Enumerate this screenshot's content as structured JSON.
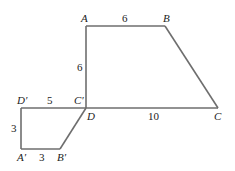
{
  "diagram": {
    "type": "geometry",
    "stroke_color": "#6e6e6e",
    "text_color": "#222222",
    "figures": [
      {
        "name": "trapezoid-ABCD",
        "vertices": [
          "A",
          "B",
          "C",
          "D"
        ],
        "points": {
          "A": [
            86,
            26
          ],
          "B": [
            165,
            26
          ],
          "C": [
            218,
            108
          ],
          "D": [
            86,
            108
          ]
        },
        "side_labels": {
          "AB": "6",
          "AD": "6",
          "DC": "10"
        }
      },
      {
        "name": "quadrilateral-A'B'C'D'",
        "vertices": [
          "A'",
          "B'",
          "C'",
          "D'"
        ],
        "points": {
          "A'": [
            21,
            149
          ],
          "B'": [
            60,
            149
          ],
          "C'": [
            86,
            108
          ],
          "D'": [
            21,
            108
          ]
        },
        "side_labels": {
          "D'C'": "5",
          "D'A'": "3",
          "A'B'": "3"
        }
      }
    ],
    "labels": {
      "A": "A",
      "B": "B",
      "C": "C",
      "D": "D",
      "A_prime": "A′",
      "B_prime": "B′",
      "C_prime": "C′",
      "D_prime": "D′",
      "AB_len": "6",
      "AD_len": "6",
      "DC_len": "10",
      "DpCp_len": "5",
      "DpAp_len": "3",
      "ApBp_len": "3"
    }
  }
}
